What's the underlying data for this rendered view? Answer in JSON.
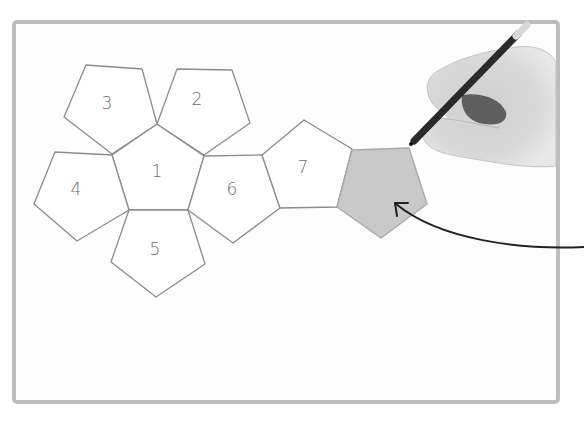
{
  "illustration": {
    "title": "Dodecahedron net drawing",
    "frame": {
      "x": 14,
      "y": 22,
      "width": 544,
      "height": 380,
      "stroke_color": "#bdbdbd",
      "paper_color": "#fdfdfd"
    },
    "pentagons": [
      {
        "id": "p1",
        "label": "1",
        "points": "157,124 204,156 188,210 129,210 112,155",
        "label_pos": [
          157,
          172
        ],
        "shaded": false
      },
      {
        "id": "p2",
        "label": "2",
        "points": "177,69 232,70 250,123 204,155 157,124",
        "label_pos": [
          197,
          100
        ],
        "shaded": false
      },
      {
        "id": "p3",
        "label": "3",
        "points": "86,65 142,69 157,124 112,154 64,117",
        "label_pos": [
          107,
          104
        ],
        "shaded": false
      },
      {
        "id": "p4",
        "label": "4",
        "points": "55,152 112,155 129,210 77,241 34,204",
        "label_pos": [
          76,
          190
        ],
        "shaded": false
      },
      {
        "id": "p5",
        "label": "5",
        "points": "129,210 188,210 205,264 156,297 111,262",
        "label_pos": [
          155,
          250
        ],
        "shaded": false
      },
      {
        "id": "p6",
        "label": "6",
        "points": "204,156 262,155 280,208 233,243 188,210",
        "label_pos": [
          232,
          190
        ],
        "shaded": false
      },
      {
        "id": "p7",
        "label": "7",
        "points": "262,155 304,120 352,149 337,207 280,208",
        "label_pos": [
          303,
          168
        ],
        "shaded": false
      },
      {
        "id": "p8",
        "label": "",
        "points": "352,150 409,148 427,204 381,238 337,207",
        "label_pos": [
          383,
          190
        ],
        "shaded": true
      }
    ],
    "colors": {
      "outline": "#8c8c8c",
      "shaded_fill": "#c9c9c9",
      "label": "#6e6e6e",
      "arrow": "#222222",
      "pencil": "#2a2a2a",
      "hand": "#d6d6d6"
    },
    "arrow": {
      "description": "curved arrow pointing to shaded pentagon",
      "from": [
        584,
        247
      ],
      "to": [
        395,
        203
      ]
    },
    "hand": {
      "description": "hand holding pencil drawing the shaded pentagon"
    }
  }
}
